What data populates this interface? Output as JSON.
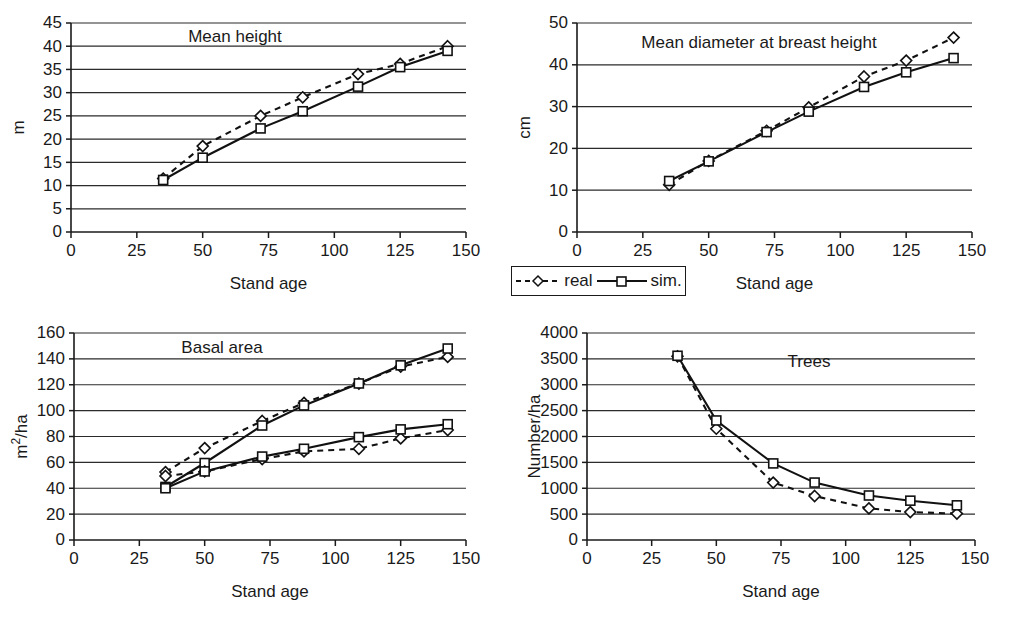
{
  "figure": {
    "series_names": {
      "real": "real",
      "sim": "sim."
    },
    "x_axis_title": "Stand age",
    "legend": {
      "real_label": "real",
      "sim_label": "sim."
    }
  },
  "chart_data": [
    {
      "id": "mean-height",
      "type": "line",
      "title": "Mean height",
      "xlabel": "Stand age",
      "ylabel": "m",
      "xlim": [
        0,
        150
      ],
      "ylim": [
        0,
        45
      ],
      "xticks": [
        0,
        25,
        50,
        75,
        100,
        125,
        150
      ],
      "yticks": [
        0,
        5,
        10,
        15,
        20,
        25,
        30,
        35,
        40,
        45
      ],
      "grid": true,
      "legend_position": "external-below-right-panel",
      "series": [
        {
          "name": "real",
          "style": "dashed-diamond",
          "x": [
            35,
            50,
            72,
            88,
            109,
            125,
            143
          ],
          "values": [
            11.5,
            18.5,
            25.0,
            29.0,
            34.0,
            36.2,
            40.0
          ]
        },
        {
          "name": "sim.",
          "style": "solid-square",
          "x": [
            35,
            50,
            72,
            88,
            109,
            125,
            143
          ],
          "values": [
            11.2,
            16.0,
            22.3,
            26.0,
            31.3,
            35.5,
            39.0
          ]
        }
      ]
    },
    {
      "id": "mean-dbh",
      "type": "line",
      "title": "Mean diameter at breast height",
      "xlabel": "Stand age",
      "ylabel": "cm",
      "xlim": [
        0,
        150
      ],
      "ylim": [
        0,
        50
      ],
      "xticks": [
        0,
        25,
        50,
        75,
        100,
        125,
        150
      ],
      "yticks": [
        0,
        10,
        20,
        30,
        40,
        50
      ],
      "grid": true,
      "series": [
        {
          "name": "real",
          "style": "dashed-diamond",
          "x": [
            35,
            50,
            72,
            88,
            109,
            125,
            143
          ],
          "values": [
            11.3,
            17.0,
            24.2,
            29.8,
            37.2,
            41.0,
            46.5
          ]
        },
        {
          "name": "sim.",
          "style": "solid-square",
          "x": [
            35,
            50,
            72,
            88,
            109,
            125,
            143
          ],
          "values": [
            12.2,
            16.9,
            23.9,
            28.8,
            34.7,
            38.2,
            41.6
          ]
        }
      ]
    },
    {
      "id": "basal-area",
      "type": "line",
      "title": "Basal area",
      "xlabel": "Stand age",
      "ylabel": "m²/ha",
      "xlim": [
        0,
        150
      ],
      "ylim": [
        0,
        160
      ],
      "xticks": [
        0,
        25,
        50,
        75,
        100,
        125,
        150
      ],
      "yticks": [
        0,
        20,
        40,
        60,
        80,
        100,
        120,
        140,
        160
      ],
      "grid": true,
      "series": [
        {
          "name": "real",
          "style": "dashed-diamond",
          "group": "upper",
          "x": [
            35,
            50,
            72,
            88,
            109,
            125,
            143
          ],
          "values": [
            52.5,
            71.0,
            92.0,
            106.0,
            121.0,
            134.0,
            141.5
          ]
        },
        {
          "name": "sim.",
          "style": "solid-square",
          "group": "upper",
          "x": [
            35,
            50,
            72,
            88,
            109,
            125,
            143
          ],
          "values": [
            41.0,
            59.5,
            88.5,
            104.0,
            121.0,
            135.0,
            148.0
          ]
        },
        {
          "name": "real",
          "style": "dashed-diamond",
          "group": "lower",
          "x": [
            35,
            50,
            72,
            88,
            109,
            125,
            143
          ],
          "values": [
            49.5,
            53.0,
            62.5,
            68.5,
            70.5,
            78.5,
            85.0
          ]
        },
        {
          "name": "sim.",
          "style": "solid-square",
          "group": "lower",
          "x": [
            35,
            50,
            72,
            88,
            109,
            125,
            143
          ],
          "values": [
            40.0,
            53.0,
            64.5,
            70.5,
            79.5,
            85.5,
            89.5
          ]
        }
      ]
    },
    {
      "id": "trees",
      "type": "line",
      "title": "Trees",
      "xlabel": "Stand age",
      "ylabel": "Number/ha",
      "xlim": [
        0,
        150
      ],
      "ylim": [
        0,
        4000
      ],
      "xticks": [
        0,
        25,
        50,
        75,
        100,
        125,
        150
      ],
      "yticks": [
        0,
        500,
        1000,
        1500,
        2000,
        2500,
        3000,
        3500,
        4000
      ],
      "grid": true,
      "series": [
        {
          "name": "real",
          "style": "dashed-diamond",
          "x": [
            35,
            50,
            72,
            88,
            109,
            125,
            143
          ],
          "values": [
            3550,
            2150,
            1110,
            850,
            610,
            540,
            510
          ]
        },
        {
          "name": "sim.",
          "style": "solid-square",
          "x": [
            35,
            50,
            72,
            88,
            109,
            125,
            143
          ],
          "values": [
            3560,
            2310,
            1480,
            1110,
            860,
            760,
            670
          ]
        }
      ]
    }
  ]
}
